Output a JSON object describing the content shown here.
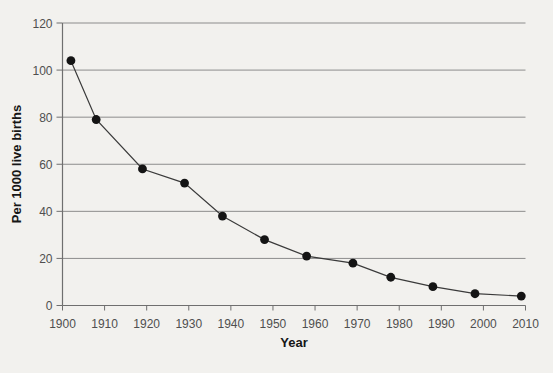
{
  "figure": {
    "background_color": "#f2f1ee",
    "grid_color": "#8c8c8c",
    "axis_color": "#6f6f6f",
    "series_line_color": "#3a3a3a",
    "point_color": "#141414",
    "tick_label_color": "#4f4f4f",
    "axis_title_color": "#161616"
  },
  "chart_data": {
    "type": "line",
    "title": "",
    "xlabel": "Year",
    "ylabel": "Per 1000 live births",
    "x": [
      1902,
      1908,
      1919,
      1929,
      1938,
      1948,
      1958,
      1969,
      1978,
      1988,
      1998,
      2009
    ],
    "y": [
      104,
      79,
      58,
      52,
      38,
      28,
      21,
      18,
      12,
      8,
      5,
      4
    ],
    "xlim": [
      1900,
      2010
    ],
    "ylim": [
      0,
      120
    ],
    "x_ticks": [
      1900,
      1910,
      1920,
      1930,
      1940,
      1950,
      1960,
      1970,
      1980,
      1990,
      2000,
      2010
    ],
    "y_ticks": [
      0,
      20,
      40,
      60,
      80,
      100,
      120
    ],
    "grid": "horizontal",
    "legend": "none",
    "marker": "filled-circle"
  }
}
